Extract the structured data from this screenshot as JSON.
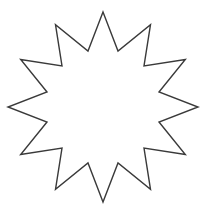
{
  "shape": {
    "type": "star",
    "points": 12,
    "fill_color": "#ffffff",
    "stroke_color": "#3a3a3a"
  }
}
